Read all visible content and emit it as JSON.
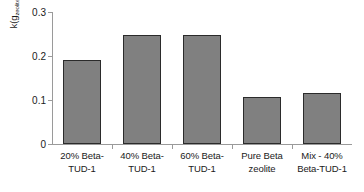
{
  "chart_data": {
    "type": "bar",
    "title": "",
    "xlabel": "",
    "ylabel": "k(g_zeolite^-1 min^-1)",
    "ylabel_parts": {
      "prefix": "k(g",
      "sub1": "zeolite",
      "sup1": "-1",
      "mid": "min",
      "sup2": "-1",
      "suffix": ")"
    },
    "categories": [
      "20% Beta-TUD-1",
      "40% Beta-TUD-1",
      "60% Beta-TUD-1",
      "Pure Beta zeolite",
      "Mix - 40% Beta-TUD-1"
    ],
    "category_lines": [
      [
        "20% Beta-",
        "TUD-1"
      ],
      [
        "40% Beta-",
        "TUD-1"
      ],
      [
        "60% Beta-",
        "TUD-1"
      ],
      [
        "Pure Beta",
        "zeolite"
      ],
      [
        "Mix - 40%",
        "Beta-TUD-1"
      ]
    ],
    "values": [
      0.19,
      0.248,
      0.248,
      0.107,
      0.115
    ],
    "ylim": [
      0,
      0.3
    ],
    "yticks": [
      0,
      0.1,
      0.2,
      0.3
    ],
    "ytick_labels": [
      "0",
      "0.1",
      "0.2",
      "0.3"
    ],
    "grid": false,
    "legend": false,
    "bar_color": "#808080",
    "bar_edge_color": "#2b2b2b",
    "axis_color": "#9a9a9a"
  }
}
